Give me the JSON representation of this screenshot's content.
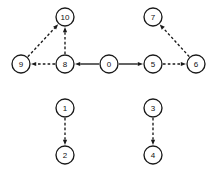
{
  "diagram": {
    "type": "directed-graph",
    "background_color": "#ffffff",
    "stroke_color": "#1a1a1a",
    "node_fill_color": "#ffffff",
    "node_radius": 9,
    "canvas": {
      "width": 212,
      "height": 174
    },
    "nodes": [
      {
        "id": "10",
        "label": "10",
        "cx": 65,
        "cy": 17
      },
      {
        "id": "7",
        "label": "7",
        "cx": 153,
        "cy": 17
      },
      {
        "id": "9",
        "label": "9",
        "cx": 21,
        "cy": 64
      },
      {
        "id": "8",
        "label": "8",
        "cx": 65,
        "cy": 64
      },
      {
        "id": "0",
        "label": "0",
        "cx": 109,
        "cy": 64
      },
      {
        "id": "5",
        "label": "5",
        "cx": 153,
        "cy": 64
      },
      {
        "id": "6",
        "label": "6",
        "cx": 196,
        "cy": 64
      },
      {
        "id": "1",
        "label": "1",
        "cx": 65,
        "cy": 108
      },
      {
        "id": "3",
        "label": "3",
        "cx": 153,
        "cy": 108
      },
      {
        "id": "2",
        "label": "2",
        "cx": 65,
        "cy": 155
      },
      {
        "id": "4",
        "label": "4",
        "cx": 153,
        "cy": 155
      }
    ],
    "edges": [
      {
        "from": "0",
        "to": "8",
        "style": "solid",
        "directed": true
      },
      {
        "from": "0",
        "to": "5",
        "style": "solid",
        "directed": true
      },
      {
        "from": "8",
        "to": "9",
        "style": "dashed",
        "directed": true
      },
      {
        "from": "8",
        "to": "10",
        "style": "dashed",
        "directed": true
      },
      {
        "from": "9",
        "to": "10",
        "style": "dashed",
        "directed": true
      },
      {
        "from": "5",
        "to": "6",
        "style": "dashed",
        "directed": true
      },
      {
        "from": "6",
        "to": "7",
        "style": "dashed",
        "directed": true
      },
      {
        "from": "1",
        "to": "2",
        "style": "dashed",
        "directed": true
      },
      {
        "from": "3",
        "to": "4",
        "style": "dashed",
        "directed": true
      }
    ]
  }
}
